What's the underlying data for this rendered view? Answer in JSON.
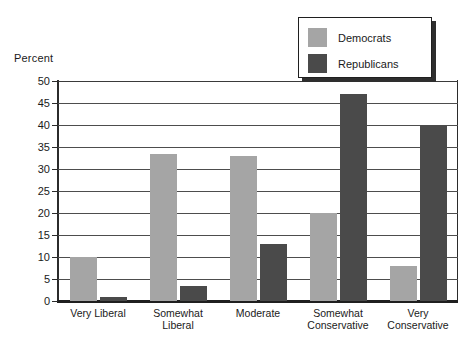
{
  "chart_data": {
    "type": "bar",
    "title": "",
    "xlabel": "",
    "ylabel": "Percent",
    "ylim": [
      0,
      50
    ],
    "ytick_step": 5,
    "yticks": [
      "50",
      "45",
      "40",
      "35",
      "30",
      "25",
      "20",
      "15",
      "10",
      "5",
      "0"
    ],
    "grid": true,
    "legend_position": "top-right",
    "categories": [
      "Very Liberal",
      "Somewhat\nLiberal",
      "Moderate",
      "Somewhat\nConservative",
      "Very\nConservative"
    ],
    "series": [
      {
        "name": "Democrats",
        "color": "#a5a5a5",
        "values": [
          10,
          33.5,
          33,
          20,
          8
        ]
      },
      {
        "name": "Republicans",
        "color": "#4a4a4a",
        "values": [
          1,
          3.5,
          13,
          47,
          40
        ]
      }
    ]
  },
  "legend": {
    "items": [
      {
        "label": "Democrats",
        "color": "#a5a5a5"
      },
      {
        "label": "Republicans",
        "color": "#4a4a4a"
      }
    ]
  }
}
